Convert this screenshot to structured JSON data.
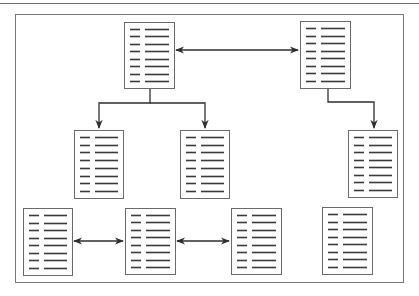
{
  "diagram": {
    "title": "",
    "colors": {
      "background": "#ffffff",
      "frame": "#777777",
      "document_border": "#6a6a6a",
      "text_lines": "#3a3a3a",
      "connectors": "#2e2e2e"
    },
    "nodes": [
      {
        "id": "A",
        "label": "",
        "x": 124,
        "y": 22,
        "w": 50,
        "h": 66,
        "lines": 8
      },
      {
        "id": "B",
        "label": "",
        "x": 300,
        "y": 21,
        "w": 50,
        "h": 67,
        "lines": 8
      },
      {
        "id": "C",
        "label": "",
        "x": 74,
        "y": 130,
        "w": 49,
        "h": 68,
        "lines": 8
      },
      {
        "id": "D",
        "label": "",
        "x": 180,
        "y": 130,
        "w": 49,
        "h": 68,
        "lines": 8
      },
      {
        "id": "E",
        "label": "",
        "x": 348,
        "y": 130,
        "w": 49,
        "h": 67,
        "lines": 8
      },
      {
        "id": "F",
        "label": "",
        "x": 23,
        "y": 208,
        "w": 49,
        "h": 67,
        "lines": 8
      },
      {
        "id": "G",
        "label": "",
        "x": 125,
        "y": 208,
        "w": 50,
        "h": 66,
        "lines": 8
      },
      {
        "id": "H",
        "label": "",
        "x": 231,
        "y": 208,
        "w": 50,
        "h": 66,
        "lines": 8
      },
      {
        "id": "I",
        "label": "",
        "x": 322,
        "y": 207,
        "w": 50,
        "h": 67,
        "lines": 8
      }
    ],
    "edges": [
      {
        "from": "A",
        "to": "B",
        "type": "bidirectional"
      },
      {
        "from": "A",
        "to": "C",
        "type": "directed"
      },
      {
        "from": "A",
        "to": "D",
        "type": "directed"
      },
      {
        "from": "B",
        "to": "E",
        "type": "directed"
      },
      {
        "from": "F",
        "to": "G",
        "type": "bidirectional"
      },
      {
        "from": "G",
        "to": "H",
        "type": "bidirectional"
      }
    ]
  }
}
